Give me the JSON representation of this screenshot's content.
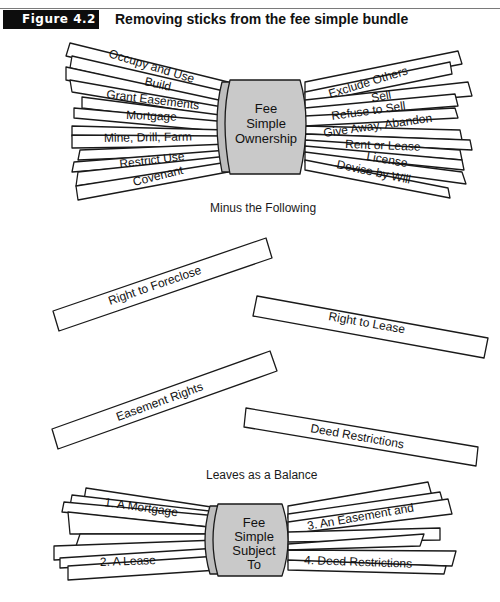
{
  "header": {
    "figure_label": "Figure 4.2",
    "title": "Removing sticks from the fee simple bundle"
  },
  "top_bundle": {
    "band": [
      "Fee",
      "Simple",
      "Ownership"
    ],
    "left_sticks": [
      "Occupy and Use",
      "Build",
      "Grant Easements",
      "Mortgage",
      "Mine, Drill, Farm",
      "Restrict Use",
      "Covenant"
    ],
    "right_sticks": [
      "Exclude Others",
      "Sell",
      "Refuse to Sell",
      "Give Away, Abandon",
      "Rent or Lease",
      "License",
      "Devise by Will"
    ]
  },
  "captions": {
    "minus": "Minus the Following",
    "leaves": "Leaves as a Balance"
  },
  "removed_sticks": [
    "Right to Foreclose",
    "Right to Lease",
    "Easement Rights",
    "Deed Restrictions"
  ],
  "bottom_bundle": {
    "band": [
      "Fee",
      "Simple",
      "Subject",
      "To"
    ],
    "left_sticks": [
      "1. A Mortgage",
      "2. A Lease"
    ],
    "right_sticks": [
      "3. An Easement and",
      "4. Deed Restrictions"
    ]
  },
  "colors": {
    "band_fill": "#c9c9c9",
    "label_box": "#0d0d0d",
    "stroke": "#1a1a1a"
  }
}
